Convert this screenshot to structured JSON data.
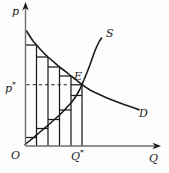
{
  "figure": {
    "type": "supply-demand-diagram",
    "background": "#fdfdfd",
    "ink": "#1a1a1a",
    "axis_color": "#6e6e6e",
    "labels": {
      "y_axis": "p",
      "x_axis": "Q",
      "origin": "O",
      "eq_price": "p",
      "eq_price_sup": "*",
      "eq_qty": "Q",
      "eq_qty_sup": "*",
      "eq_point": "E",
      "supply": "S",
      "demand": "D"
    },
    "geometry": {
      "canvas": {
        "w": 169,
        "h": 173
      },
      "origin": {
        "x": 25.5,
        "y": 146
      },
      "y_axis_top": 7,
      "x_axis_right": 158,
      "equilibrium": {
        "x": 82,
        "y": 84.5
      },
      "demand_points": [
        [
          26.5,
          31
        ],
        [
          30,
          36.5
        ],
        [
          33,
          41
        ],
        [
          36.5,
          45
        ],
        [
          40,
          49
        ],
        [
          44,
          53.3
        ],
        [
          48,
          57
        ],
        [
          52,
          60.5
        ],
        [
          56,
          63.9
        ],
        [
          59.5,
          67
        ],
        [
          63.5,
          70
        ],
        [
          67,
          72.7
        ],
        [
          71,
          76
        ],
        [
          75,
          79
        ],
        [
          78.5,
          81.8
        ],
        [
          82,
          84.5
        ],
        [
          86,
          87.4
        ],
        [
          90,
          90
        ],
        [
          95,
          92.5
        ],
        [
          100,
          94.8
        ],
        [
          106,
          97.5
        ],
        [
          112,
          100
        ],
        [
          118,
          102.3
        ],
        [
          124,
          104.5
        ],
        [
          130,
          106.6
        ],
        [
          135,
          108.3
        ],
        [
          139,
          109.8
        ]
      ],
      "supply_points": [
        [
          25,
          144.5
        ],
        [
          30,
          140.5
        ],
        [
          35,
          136.3
        ],
        [
          40,
          132
        ],
        [
          45,
          127.8
        ],
        [
          50,
          123.5
        ],
        [
          55,
          119
        ],
        [
          59.5,
          115
        ],
        [
          64,
          110.5
        ],
        [
          68,
          106
        ],
        [
          71,
          103
        ],
        [
          74,
          99
        ],
        [
          77,
          94.5
        ],
        [
          79.5,
          90
        ],
        [
          82,
          84.5
        ],
        [
          84.5,
          78.5
        ],
        [
          87,
          72.5
        ],
        [
          89.5,
          66
        ],
        [
          92,
          59
        ],
        [
          94.5,
          52
        ],
        [
          97,
          46
        ],
        [
          99.5,
          41
        ],
        [
          101.5,
          38
        ]
      ],
      "bar_edges": [
        {
          "x": 36.5,
          "top": 45
        },
        {
          "x": 48,
          "top": 57
        },
        {
          "x": 59.5,
          "top": 67
        },
        {
          "x": 71,
          "top": 76
        },
        {
          "x": 82,
          "top": 84.5
        }
      ],
      "demand_steps": [
        {
          "y": 45,
          "x1": 25.5,
          "x2": 36.5
        },
        {
          "y": 57,
          "x1": 36.5,
          "x2": 48
        },
        {
          "y": 67,
          "x1": 48,
          "x2": 59.5
        },
        {
          "y": 76,
          "x1": 59.5,
          "x2": 71
        },
        {
          "y": 84.8,
          "x1": 71,
          "x2": 82
        }
      ],
      "supply_steps": [
        {
          "y": 137.5,
          "x1": 25.5,
          "x2": 36.5
        },
        {
          "y": 128.5,
          "x1": 36.5,
          "x2": 48
        },
        {
          "y": 119.5,
          "x1": 48,
          "x2": 59.5
        },
        {
          "y": 110,
          "x1": 59.5,
          "x2": 71
        },
        {
          "y": 95.5,
          "x1": 71,
          "x2": 82
        }
      ],
      "dashed_price_line": {
        "y": 84.8,
        "x1": 26.5,
        "x2": 70.5
      }
    }
  }
}
